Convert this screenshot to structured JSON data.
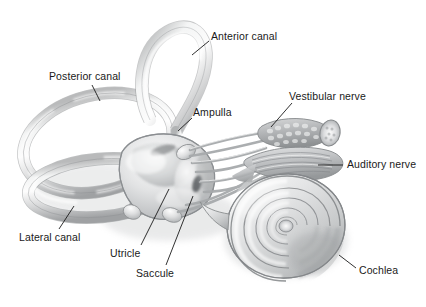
{
  "figure": {
    "background_color": "#ffffff",
    "ink_color": "#1a1a1a",
    "width": 426,
    "height": 307
  },
  "labels": [
    {
      "id": "anterior-canal",
      "text": "Anterior canal",
      "x": 211,
      "y": 31,
      "leader": {
        "x1": 209,
        "y1": 41,
        "x2": 192,
        "y2": 55
      }
    },
    {
      "id": "posterior-canal",
      "text": "Posterior canal",
      "x": 49,
      "y": 71,
      "leader": {
        "x1": 92,
        "y1": 85,
        "x2": 100,
        "y2": 101
      }
    },
    {
      "id": "ampulla",
      "text": "Ampulla",
      "x": 193,
      "y": 107,
      "leader": {
        "x1": 192,
        "y1": 118,
        "x2": 178,
        "y2": 131
      }
    },
    {
      "id": "vestibular-nerve",
      "text": "Vestibular nerve",
      "x": 289,
      "y": 91,
      "leader": {
        "x1": 292,
        "y1": 103,
        "x2": 271,
        "y2": 127
      }
    },
    {
      "id": "auditory-nerve",
      "text": "Auditory nerve",
      "x": 347,
      "y": 159,
      "leader": {
        "x1": 318,
        "y1": 165,
        "x2": 343,
        "y2": 165
      }
    },
    {
      "id": "cochlea",
      "text": "Cochlea",
      "x": 359,
      "y": 265,
      "leader": {
        "x1": 356,
        "y1": 268,
        "x2": 339,
        "y2": 255
      }
    },
    {
      "id": "saccule",
      "text": "Saccule",
      "x": 136,
      "y": 268,
      "leader": {
        "x1": 166,
        "y1": 265,
        "x2": 193,
        "y2": 196
      }
    },
    {
      "id": "utricle",
      "text": "Utricle",
      "x": 110,
      "y": 248,
      "leader": {
        "x1": 141,
        "y1": 245,
        "x2": 169,
        "y2": 189
      }
    },
    {
      "id": "lateral-canal",
      "text": "Lateral canal",
      "x": 19,
      "y": 232,
      "leader": {
        "x1": 59,
        "y1": 229,
        "x2": 74,
        "y2": 206
      }
    }
  ],
  "structures": {
    "anterior_canal": "anterior semicircular canal loop",
    "posterior_canal": "posterior semicircular canal loop",
    "lateral_canal": "lateral (horizontal) semicircular canal loop",
    "vestibule": "vestibule containing utricle and saccule",
    "ampulla": "ampullae at canal bases",
    "cochlea": "spiral cochlea, about two and a half turns",
    "vestibular_nerve": "vestibular nerve bundle",
    "auditory_nerve": "auditory (cochlear) nerve bundle"
  }
}
